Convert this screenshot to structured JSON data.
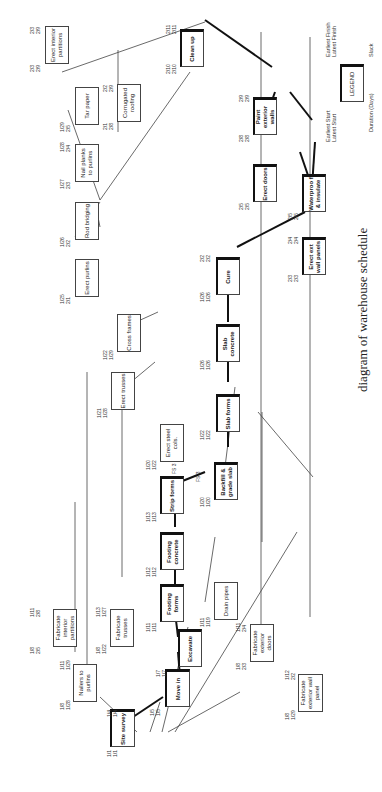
{
  "caption": "diagram of warehouse schedule",
  "legend": {
    "box_label": "LEGEND",
    "earliest_start": "Earliest Start",
    "latest_start": "Latest Start",
    "earliest_finish": "Earliest Finish",
    "latest_finish": "Latest Finish",
    "duration": "Duration (Days)",
    "slack": "Slack"
  },
  "annotations": {
    "fs3_a": "FS 3",
    "fs3_b": "FS 3"
  },
  "nodes": [
    {
      "id": "site_survey",
      "label": "Site survey",
      "es": "1/1",
      "ls": "1/1",
      "ef": "1/4",
      "lf": "1/4",
      "dur": "1",
      "slack": "0",
      "critical": true
    },
    {
      "id": "move_in",
      "label": "Move in",
      "es": "1/5",
      "ls": "1/5",
      "ef": "1/7",
      "lf": "1/7",
      "dur": "3",
      "slack": "0",
      "critical": true
    },
    {
      "id": "nailers",
      "label": "Nailers to purlins",
      "es": "1/8",
      "ls": "1/28",
      "ef": "1/11",
      "lf": "1/29",
      "dur": "2",
      "slack": "13",
      "critical": false
    },
    {
      "id": "fab_int_part",
      "label": "Fabricate interior partitions",
      "es": "1/8",
      "ls": "2/5",
      "ef": "1/11",
      "lf": "2/8",
      "dur": "2",
      "slack": "19",
      "critical": false
    },
    {
      "id": "fab_trusses",
      "label": "Fabricate trusses",
      "es": "1/8",
      "ls": "1/22",
      "ef": "1/13",
      "lf": "1/27",
      "dur": "4",
      "slack": "9",
      "critical": false
    },
    {
      "id": "excavate",
      "label": "Excavate",
      "es": "1/8",
      "ls": "1/8",
      "ef": "1/11",
      "lf": "1/11",
      "dur": "3",
      "slack": "0",
      "critical": true
    },
    {
      "id": "footing_forms",
      "label": "Footing forms",
      "es": "1/11",
      "ls": "1/11",
      "ef": "1/11",
      "lf": "1/11",
      "dur": "1",
      "slack": "0",
      "critical": true
    },
    {
      "id": "footing_concrete",
      "label": "Footing concrete",
      "es": "1/12",
      "ls": "1/12",
      "ef": "1/12",
      "lf": "1/12",
      "dur": "1",
      "slack": "0",
      "critical": true
    },
    {
      "id": "strip_forms",
      "label": "Strip forms",
      "es": "1/13",
      "ls": "1/13",
      "ef": "1/13",
      "lf": "1/13",
      "dur": "1",
      "slack": "0",
      "critical": true
    },
    {
      "id": "drain_pipes",
      "label": "Drain pipes",
      "es": "1/11",
      "ls": "1/19",
      "ef": "1/11",
      "lf": "1/19",
      "dur": "1",
      "slack": "5",
      "critical": false
    },
    {
      "id": "fab_ext_doors",
      "label": "Fabricate exterior doors",
      "es": "1/8",
      "ls": "2/3",
      "ef": "1/11",
      "lf": "2/4",
      "dur": "2",
      "slack": "17",
      "critical": false
    },
    {
      "id": "fab_ext_wall",
      "label": "Fabricate exterior wall panel",
      "es": "1/8",
      "ls": "1/29",
      "ef": "1/12",
      "lf": "2/2",
      "dur": "3",
      "slack": "14",
      "critical": false
    },
    {
      "id": "erect_steel",
      "label": "Erect steel cols.",
      "es": "1/20",
      "ls": "1/22",
      "ef": "1/20",
      "lf": "1/22",
      "dur": "1",
      "slack": "2",
      "critical": false
    },
    {
      "id": "erect_trusses",
      "label": "Erect trusses",
      "es": "1/21",
      "ls": "1/28",
      "ef": "1/21",
      "lf": "1/28",
      "dur": "1",
      "slack": "5",
      "critical": false
    },
    {
      "id": "cross_frames",
      "label": "Cross frames",
      "es": "1/22",
      "ls": "1/29",
      "ef": "1/22",
      "lf": "1/29",
      "dur": "1",
      "slack": "5",
      "critical": false
    },
    {
      "id": "backfill",
      "label": "Backfill & grade slab",
      "es": "1/20",
      "ls": "1/20",
      "ef": "1/21",
      "lf": "1/21",
      "dur": "2",
      "slack": "0",
      "critical": true
    },
    {
      "id": "slab_forms",
      "label": "Slab forms",
      "es": "1/22",
      "ls": "1/22",
      "ef": "1/22",
      "lf": "1/22",
      "dur": "1",
      "slack": "0",
      "critical": true
    },
    {
      "id": "slab_concrete",
      "label": "Slab concrete",
      "es": "1/26",
      "ls": "1/26",
      "ef": "1/26",
      "lf": "1/26",
      "dur": "1",
      "slack": "0",
      "critical": true
    },
    {
      "id": "cure",
      "label": "Cure",
      "es": "1/26",
      "ls": "1/26",
      "ef": "2/2",
      "lf": "2/2",
      "dur": "8",
      "slack": "0",
      "critical": true
    },
    {
      "id": "erect_purlins",
      "label": "Erect purlins",
      "es": "1/25",
      "ls": "2/1",
      "ef": "1/25",
      "lf": "2/1",
      "dur": "1",
      "slack": "5",
      "critical": false
    },
    {
      "id": "rod_bridging",
      "label": "Rod bridging",
      "es": "1/26",
      "ls": "2/2",
      "ef": "1/26",
      "lf": "2/2",
      "dur": "1",
      "slack": "5",
      "critical": false
    },
    {
      "id": "nail_planks",
      "label": "Nail planks to purlins",
      "es": "1/27",
      "ls": "2/3",
      "ef": "1/28",
      "lf": "2/4",
      "dur": "2",
      "slack": "5",
      "critical": false
    },
    {
      "id": "tar_paper",
      "label": "Tar paper",
      "es": "1/29",
      "ls": "2/5",
      "ef": "1/29",
      "lf": "2/5",
      "dur": "1",
      "slack": "5",
      "critical": false
    },
    {
      "id": "erect_int_part",
      "label": "Erect interior partitions",
      "es": "2/3",
      "ls": "2/9",
      "ef": "2/3",
      "lf": "2/9",
      "dur": "1",
      "slack": "4",
      "critical": false
    },
    {
      "id": "corrugated",
      "label": "Corrugated roofing",
      "es": "2/1",
      "ls": "2/8",
      "ef": "2/2",
      "lf": "2/9",
      "dur": "2",
      "slack": "5",
      "critical": false
    },
    {
      "id": "erect_ext_wall",
      "label": "Erect ext wall panels",
      "es": "2/3",
      "ls": "2/3",
      "ef": "2/4",
      "lf": "2/4",
      "dur": "2",
      "slack": "0",
      "critical": true
    },
    {
      "id": "erect_doors",
      "label": "Erect doors",
      "es": "2/5",
      "ls": "2/5",
      "ef": "2/5",
      "lf": "2/5",
      "dur": "1",
      "slack": "0",
      "critical": true
    },
    {
      "id": "waterproof",
      "label": "Waterproo f & insulate",
      "es": "2/5",
      "ls": "2/5",
      "ef": "2/5",
      "lf": "2/5",
      "dur": "1",
      "slack": "0",
      "critical": true
    },
    {
      "id": "paint_ext",
      "label": "Paint exterior walls",
      "es": "2/8",
      "ls": "2/8",
      "ef": "2/9",
      "lf": "2/9",
      "dur": "2",
      "slack": "0",
      "critical": true
    },
    {
      "id": "clean_up",
      "label": "Clean up",
      "es": "2/10",
      "ls": "2/10",
      "ef": "2/11",
      "lf": "2/11",
      "dur": "2",
      "slack": "0",
      "critical": true
    }
  ]
}
